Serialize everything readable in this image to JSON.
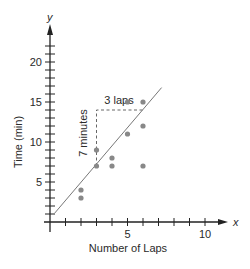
{
  "chart_data": {
    "type": "scatter",
    "title": "",
    "xlabel": "Number of Laps",
    "ylabel": "Time (min)",
    "x_axis_symbol": "x",
    "y_axis_symbol": "y",
    "xlim": [
      0,
      11
    ],
    "ylim": [
      0,
      23
    ],
    "x_ticks": [
      1,
      2,
      3,
      4,
      5,
      6,
      7,
      8,
      9,
      10
    ],
    "x_tick_labels": [
      {
        "value": 5,
        "label": "5"
      },
      {
        "value": 10,
        "label": "10"
      }
    ],
    "y_ticks": [
      1,
      2,
      3,
      4,
      5,
      6,
      7,
      8,
      9,
      10,
      11,
      12,
      13,
      14,
      15,
      16,
      17,
      18,
      19,
      20,
      21,
      22
    ],
    "y_tick_labels": [
      {
        "value": 5,
        "label": "5"
      },
      {
        "value": 10,
        "label": "10"
      },
      {
        "value": 15,
        "label": "15"
      },
      {
        "value": 20,
        "label": "20"
      }
    ],
    "grid": false,
    "legend": null,
    "series": [
      {
        "name": "Data",
        "points": [
          {
            "x": 2,
            "y": 3
          },
          {
            "x": 2,
            "y": 4
          },
          {
            "x": 3,
            "y": 7
          },
          {
            "x": 3,
            "y": 9
          },
          {
            "x": 4,
            "y": 7
          },
          {
            "x": 4,
            "y": 8
          },
          {
            "x": 5,
            "y": 11
          },
          {
            "x": 5,
            "y": 15
          },
          {
            "x": 6,
            "y": 7
          },
          {
            "x": 6,
            "y": 12
          },
          {
            "x": 6,
            "y": 15
          }
        ],
        "color": "#888888"
      }
    ],
    "trend_line": {
      "slope": 2.3333,
      "intercept": 0,
      "x_start": 0.3,
      "x_end": 7.2,
      "color": "#777777"
    },
    "annotations": [
      {
        "type": "slope-triangle",
        "run_label": "3 laps",
        "rise_label": "7 minutes",
        "from": {
          "x": 3,
          "y": 7
        },
        "corner": {
          "x": 3,
          "y": 14
        },
        "to": {
          "x": 6,
          "y": 14
        }
      }
    ]
  },
  "labels": {
    "x_axis_title": "Number of Laps",
    "y_axis_title": "Time (min)",
    "x_symbol": "x",
    "y_symbol": "y",
    "run_label": "3 laps",
    "rise_label": "7 minutes",
    "x_tick_5": "5",
    "x_tick_10": "10",
    "y_tick_5": "5",
    "y_tick_10": "10",
    "y_tick_15": "15",
    "y_tick_20": "20"
  }
}
